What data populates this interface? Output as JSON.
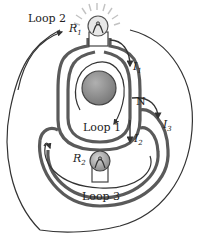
{
  "diagram": {
    "type": "circuit-loops",
    "labels": {
      "loop1": "Loop 1",
      "loop2": "Loop 2",
      "loop3": "Loop 3",
      "node": "N",
      "r1": "R",
      "r1_sub": "1",
      "r2": "R",
      "r2_sub": "2",
      "i1": "I",
      "i1_sub": "1",
      "i2": "I",
      "i2_sub": "2",
      "i3": "I",
      "i3_sub": "3"
    },
    "colors": {
      "wire": "#5a5a5a",
      "loop_line": "#333333",
      "battery": "#8a8a8a",
      "bulb_glow": "#bdbdbd",
      "bulb_fill": "#e6e6e6",
      "background": "#ffffff"
    }
  }
}
